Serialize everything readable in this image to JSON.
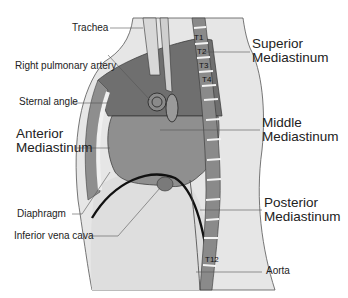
{
  "labels": {
    "trachea": "Trachea",
    "right_pulmonary_artery": "Right pulmonary artery",
    "sternal_angle": "Sternal angle",
    "anterior_l1": "Anterior",
    "anterior_l2": "Mediastinum",
    "diaphragm": "Diaphragm",
    "ivc": "Inferior vena cava",
    "superior_l1": "Superior",
    "superior_l2": "Mediastinum",
    "middle_l1": "Middle",
    "middle_l2": "Mediastinum",
    "posterior_l1": "Posterior",
    "posterior_l2": "Mediastinum",
    "aorta": "Aorta"
  },
  "vertebrae": [
    "T1",
    "T2",
    "T3",
    "T4",
    "T12"
  ],
  "colors": {
    "background": "#ffffff",
    "body_outline": "#e4e4e4",
    "superior_region": "#6e6e6e",
    "heart": "#8c8c8c",
    "anterior_strip": "#9a9a9a",
    "abdomen": "#e0e0e0",
    "spine_body": "#8a8a8a",
    "disc": "#f2f2f2",
    "diaphragm_line": "#111111"
  }
}
